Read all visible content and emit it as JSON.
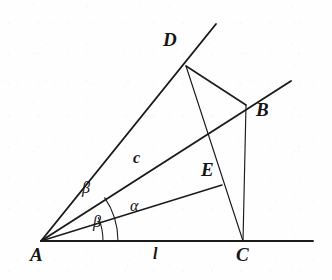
{
  "figure": {
    "kind": "geometry-diagram",
    "width": 332,
    "height": 280,
    "background_color": "#fefefe",
    "stroke_color": "#1a1a1a",
    "points": {
      "A": {
        "label": "A",
        "x": 41,
        "y": 241,
        "label_x": 30,
        "label_y": 248
      },
      "B": {
        "label": "B",
        "x": 246,
        "y": 105,
        "label_x": 256,
        "label_y": 104
      },
      "C": {
        "label": "C",
        "x": 243,
        "y": 241,
        "label_x": 236,
        "label_y": 248
      },
      "D": {
        "label": "D",
        "x": 186,
        "y": 66,
        "label_x": 163,
        "label_y": 38
      },
      "E": {
        "label": "E",
        "x": 222,
        "y": 185,
        "label_x": 200,
        "label_y": 166
      }
    },
    "segment_labels": [
      {
        "name": "c",
        "label": "c",
        "x": 132,
        "y": 152,
        "belongs_to": "A-B"
      },
      {
        "name": "l",
        "label": "l",
        "x": 152,
        "y": 248,
        "belongs_to": "A-C"
      }
    ],
    "angle_labels": [
      {
        "name": "beta-upper",
        "label": "β",
        "x": 82,
        "y": 182,
        "between": "AD and AB"
      },
      {
        "name": "alpha",
        "label": "α",
        "x": 130,
        "y": 200,
        "between": "AB and AE"
      },
      {
        "name": "beta-lower",
        "label": "β",
        "x": 92,
        "y": 218,
        "between": "AE and AC"
      }
    ],
    "lines": [
      {
        "name": "ray-A-D",
        "from": "A",
        "to_x": 216,
        "to_y": 24,
        "weight": 1.7
      },
      {
        "name": "ray-A-B",
        "from": "A",
        "to_x": 291,
        "to_y": 81,
        "weight": 1.7
      },
      {
        "name": "segment-A-E",
        "from": "A",
        "to_x": 222,
        "to_y": 185,
        "weight": 1.3
      },
      {
        "name": "baseline-l",
        "from": "A",
        "to_x": 313,
        "to_y": 241,
        "weight": 1.7
      },
      {
        "name": "segment-D-B",
        "from": "D",
        "to_x": 246,
        "to_y": 105,
        "weight": 1.5
      },
      {
        "name": "segment-D-C",
        "from": "D",
        "to_x": 243,
        "to_y": 241,
        "weight": 1.1
      },
      {
        "name": "segment-B-C",
        "from": "B",
        "to_x": 243,
        "to_y": 241,
        "weight": 1.1
      }
    ],
    "arcs": [
      {
        "name": "arc-outer",
        "radius": 77,
        "start_deg": 34.5,
        "end_deg": 0,
        "weight": 1.0
      },
      {
        "name": "arc-inner",
        "radius": 62,
        "start_deg": 22.5,
        "end_deg": 0,
        "weight": 1.0
      }
    ]
  }
}
